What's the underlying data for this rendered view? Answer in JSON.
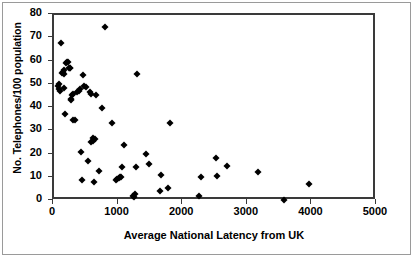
{
  "chart_data": {
    "type": "scatter",
    "title": "",
    "xlabel": "Average National Latency from UK",
    "ylabel": "No. Telephones/100 population",
    "xlim": [
      0,
      5000
    ],
    "ylim": [
      0,
      80
    ],
    "xticks": [
      0,
      1000,
      2000,
      3000,
      4000,
      5000
    ],
    "yticks": [
      0,
      10,
      20,
      30,
      40,
      50,
      60,
      70,
      80
    ],
    "xtick_labels": [
      "0",
      "1000",
      "2000",
      "3000",
      "4000",
      "5000"
    ],
    "ytick_labels": [
      "0",
      "10",
      "20",
      "30",
      "40",
      "50",
      "60",
      "70",
      "80"
    ],
    "grid": false,
    "legend": false,
    "marker": "diamond",
    "marker_color": "#000000",
    "series": [
      {
        "name": "countries",
        "points": [
          [
            60,
            49.5
          ],
          [
            70,
            50.5
          ],
          [
            75,
            48.0
          ],
          [
            90,
            47.5
          ],
          [
            110,
            68.0
          ],
          [
            120,
            55.0
          ],
          [
            140,
            55.5
          ],
          [
            150,
            54.5
          ],
          [
            155,
            56.5
          ],
          [
            160,
            48.5
          ],
          [
            165,
            37.3
          ],
          [
            185,
            59.5
          ],
          [
            195,
            60.0
          ],
          [
            210,
            60.0
          ],
          [
            230,
            57.0
          ],
          [
            240,
            57.0
          ],
          [
            250,
            57.0
          ],
          [
            260,
            44.0
          ],
          [
            270,
            43.5
          ],
          [
            285,
            45.5
          ],
          [
            290,
            35.0
          ],
          [
            300,
            46.0
          ],
          [
            320,
            35.0
          ],
          [
            350,
            47.0
          ],
          [
            380,
            47.5
          ],
          [
            400,
            48.0
          ],
          [
            420,
            21.0
          ],
          [
            430,
            9.2
          ],
          [
            450,
            54.0
          ],
          [
            470,
            49.5
          ],
          [
            490,
            49.0
          ],
          [
            520,
            17.0
          ],
          [
            560,
            47.0
          ],
          [
            570,
            46.0
          ],
          [
            580,
            25.5
          ],
          [
            600,
            26.0
          ],
          [
            610,
            27.0
          ],
          [
            620,
            8.0
          ],
          [
            630,
            26.5
          ],
          [
            650,
            45.5
          ],
          [
            700,
            13.0
          ],
          [
            740,
            39.8
          ],
          [
            790,
            74.8
          ],
          [
            900,
            33.4
          ],
          [
            960,
            9.2
          ],
          [
            980,
            9.3
          ],
          [
            1000,
            10.0
          ],
          [
            1020,
            10.2
          ],
          [
            1040,
            10.4
          ],
          [
            1060,
            14.5
          ],
          [
            1090,
            24.2
          ],
          [
            1230,
            2.2
          ],
          [
            1240,
            1.8
          ],
          [
            1250,
            3.0
          ],
          [
            1270,
            14.8
          ],
          [
            1290,
            54.5
          ],
          [
            1430,
            20.4
          ],
          [
            1470,
            16.1
          ],
          [
            1640,
            4.5
          ],
          [
            1660,
            11.1
          ],
          [
            1770,
            5.6
          ],
          [
            1790,
            33.7
          ],
          [
            2250,
            2.1
          ],
          [
            2280,
            10.2
          ],
          [
            2510,
            18.4
          ],
          [
            2520,
            10.8
          ],
          [
            2680,
            14.9
          ],
          [
            3160,
            12.3
          ],
          [
            3560,
            0.5
          ],
          [
            3940,
            7.5
          ]
        ]
      }
    ]
  },
  "axis": {
    "y_title": "No. Telephones/100 population",
    "x_title": "Average National Latency from UK"
  }
}
